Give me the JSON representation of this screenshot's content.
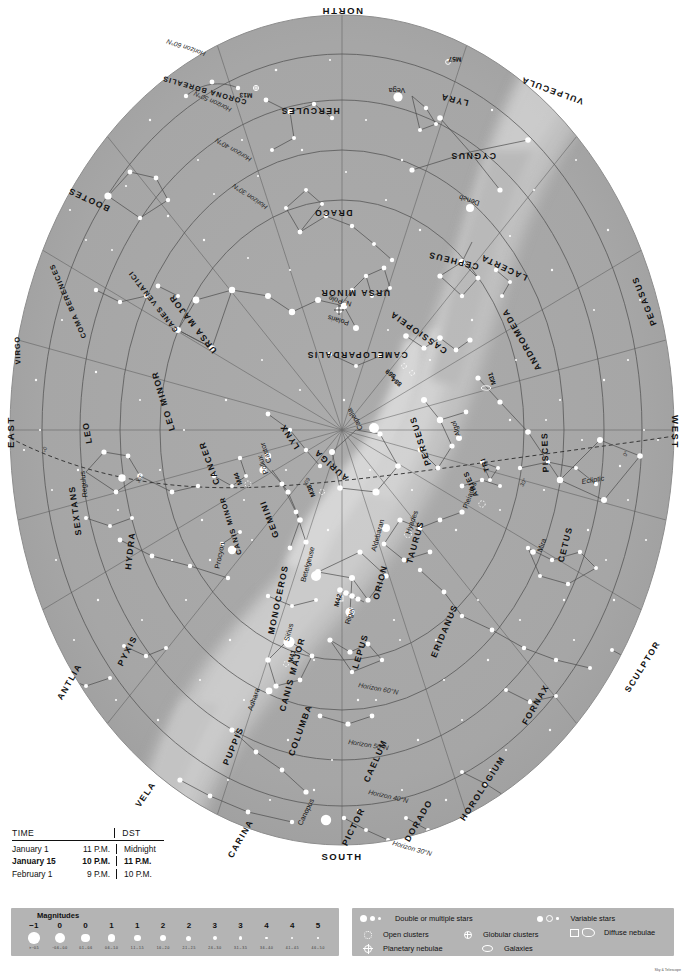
{
  "chart": {
    "cardinals": {
      "north": "NORTH",
      "south": "SOUTH",
      "east": "EAST",
      "west": "WEST"
    },
    "pole_marker": {
      "star": "Polaris",
      "label": "N. Pole"
    },
    "ecliptic_label": "Ecliptic",
    "altitude_marks": [
      "0°",
      "30°",
      "60°"
    ],
    "horizon_lines": [
      "Horizon 30°N",
      "Horizon 40°N",
      "Horizon 50°N",
      "Horizon 60°N"
    ],
    "constellations": [
      {
        "name": "CORONA BOREALIS",
        "x": 205,
        "y": 88,
        "rot": 196,
        "size": "small"
      },
      {
        "name": "HERCULES",
        "x": 310,
        "y": 108,
        "rot": 180
      },
      {
        "name": "LYRA",
        "x": 455,
        "y": 97,
        "rot": 194
      },
      {
        "name": "VULPECULA",
        "x": 553,
        "y": 88,
        "rot": 200
      },
      {
        "name": "CYGNUS",
        "x": 473,
        "y": 153,
        "rot": 180
      },
      {
        "name": "BOOTES",
        "x": 90,
        "y": 197,
        "rot": 205
      },
      {
        "name": "DRACO",
        "x": 333,
        "y": 210,
        "rot": 180
      },
      {
        "name": "CEPHEUS",
        "x": 454,
        "y": 258,
        "rot": 194
      },
      {
        "name": "LACERTA",
        "x": 505,
        "y": 265,
        "rot": 205
      },
      {
        "name": "COMA BERENICES",
        "x": 70,
        "y": 300,
        "rot": 246,
        "size": "small"
      },
      {
        "name": "CANES VENATICI",
        "x": 155,
        "y": 300,
        "rot": 232,
        "size": "small"
      },
      {
        "name": "URSA MAJOR",
        "x": 195,
        "y": 322,
        "rot": 232
      },
      {
        "name": "URSA MINOR",
        "x": 355,
        "y": 290,
        "rot": 180
      },
      {
        "name": "CASSIOPEIA",
        "x": 420,
        "y": 330,
        "rot": 215
      },
      {
        "name": "CAMELOPARDALIS",
        "x": 357,
        "y": 352,
        "rot": 180
      },
      {
        "name": "ANDROMEDA",
        "x": 524,
        "y": 338,
        "rot": 240
      },
      {
        "name": "PEGASUS",
        "x": 647,
        "y": 300,
        "rot": 248
      },
      {
        "name": "VIRGO",
        "x": 20,
        "y": 350,
        "rot": 268,
        "size": "small"
      },
      {
        "name": "LEO MINOR",
        "x": 166,
        "y": 400,
        "rot": 253
      },
      {
        "name": "LEO",
        "x": 90,
        "y": 432,
        "rot": 260
      },
      {
        "name": "LYNX",
        "x": 292,
        "y": 435,
        "rot": 237
      },
      {
        "name": "AURIGA",
        "x": 333,
        "y": 463,
        "rot": 222
      },
      {
        "name": "PERSEUS",
        "x": 423,
        "y": 440,
        "rot": 252
      },
      {
        "name": "TRI",
        "x": 487,
        "y": 464,
        "rot": 250,
        "size": "small"
      },
      {
        "name": "ARIES",
        "x": 473,
        "y": 483,
        "rot": 246,
        "size": "small"
      },
      {
        "name": "PISCES",
        "x": 548,
        "y": 452,
        "rot": 268
      },
      {
        "name": "CANCER",
        "x": 212,
        "y": 462,
        "rot": 250
      },
      {
        "name": "GEMINI",
        "x": 272,
        "y": 518,
        "rot": 249
      },
      {
        "name": "CANIS MINOR",
        "x": 233,
        "y": 525,
        "rot": 253,
        "size": "small"
      },
      {
        "name": "TAURUS",
        "x": 418,
        "y": 543,
        "rot": 286
      },
      {
        "name": "CETUS",
        "x": 568,
        "y": 545,
        "rot": 284
      },
      {
        "name": "SEXTANS",
        "x": 78,
        "y": 510,
        "rot": 262
      },
      {
        "name": "HYDRA",
        "x": 133,
        "y": 551,
        "rot": 276
      },
      {
        "name": "ORION",
        "x": 383,
        "y": 583,
        "rot": 285
      },
      {
        "name": "MONOCEROS",
        "x": 281,
        "y": 600,
        "rot": 282
      },
      {
        "name": "ERIDANUS",
        "x": 447,
        "y": 632,
        "rot": 293
      },
      {
        "name": "LEPUS",
        "x": 363,
        "y": 652,
        "rot": 287
      },
      {
        "name": "CANIS MAJOR",
        "x": 295,
        "y": 675,
        "rot": 285
      },
      {
        "name": "ANTLIA",
        "x": 72,
        "y": 683,
        "rot": 300
      },
      {
        "name": "PYXIS",
        "x": 130,
        "y": 652,
        "rot": 297
      },
      {
        "name": "SCULPTOR",
        "x": 645,
        "y": 668,
        "rot": 302
      },
      {
        "name": "FORNAX",
        "x": 538,
        "y": 706,
        "rot": 300
      },
      {
        "name": "COLUMBA",
        "x": 303,
        "y": 731,
        "rot": 290
      },
      {
        "name": "CAELUM",
        "x": 378,
        "y": 762,
        "rot": 294
      },
      {
        "name": "PUPPIS",
        "x": 236,
        "y": 747,
        "rot": 293
      },
      {
        "name": "HOROLOGIUM",
        "x": 485,
        "y": 790,
        "rot": 303
      },
      {
        "name": "VELA",
        "x": 148,
        "y": 796,
        "rot": 305
      },
      {
        "name": "DORADO",
        "x": 421,
        "y": 822,
        "rot": 300
      },
      {
        "name": "PICTOR",
        "x": 356,
        "y": 828,
        "rot": 296
      },
      {
        "name": "CARINA",
        "x": 243,
        "y": 840,
        "rot": 300
      }
    ],
    "named_stars": [
      {
        "name": "Vega",
        "x": 397,
        "y": 88,
        "rot": 180
      },
      {
        "name": "Deneb",
        "x": 470,
        "y": 198,
        "rot": 198
      },
      {
        "name": "Polaris",
        "x": 339,
        "y": 318,
        "rot": 196
      },
      {
        "name": "Capella",
        "x": 357,
        "y": 418,
        "rot": 240
      },
      {
        "name": "Algol",
        "x": 458,
        "y": 428,
        "rot": 252
      },
      {
        "name": "Castor",
        "x": 268,
        "y": 452,
        "rot": 250
      },
      {
        "name": "Pollux",
        "x": 265,
        "y": 464,
        "rot": 250
      },
      {
        "name": "Pleiades",
        "x": 472,
        "y": 496,
        "rot": 290
      },
      {
        "name": "Regulus",
        "x": 86,
        "y": 484,
        "rot": 264
      },
      {
        "name": "Aldebaran",
        "x": 380,
        "y": 536,
        "rot": 285
      },
      {
        "name": "Hyades",
        "x": 414,
        "y": 523,
        "rot": 290
      },
      {
        "name": "Mira",
        "x": 544,
        "y": 546,
        "rot": 290
      },
      {
        "name": "Procyon",
        "x": 222,
        "y": 556,
        "rot": 282
      },
      {
        "name": "Betelgeuse",
        "x": 310,
        "y": 565,
        "rot": 285
      },
      {
        "name": "Rigel",
        "x": 352,
        "y": 617,
        "rot": 287
      },
      {
        "name": "Sirius",
        "x": 291,
        "y": 633,
        "rot": 285
      },
      {
        "name": "Adhara",
        "x": 256,
        "y": 700,
        "rot": 290
      },
      {
        "name": "Canopus",
        "x": 308,
        "y": 813,
        "rot": 296
      }
    ],
    "deep_sky_objects": [
      {
        "name": "M57",
        "x": 455,
        "y": 57,
        "rot": 182
      },
      {
        "name": "M13",
        "x": 246,
        "y": 93,
        "rot": 182
      },
      {
        "name": "869",
        "x": 392,
        "y": 372,
        "rot": 218
      },
      {
        "name": "884",
        "x": 398,
        "y": 380,
        "rot": 218
      },
      {
        "name": "M31",
        "x": 494,
        "y": 378,
        "rot": 252
      },
      {
        "name": "M44",
        "x": 240,
        "y": 478,
        "rot": 250
      },
      {
        "name": "M38",
        "x": 313,
        "y": 490,
        "rot": 248
      },
      {
        "name": "M42",
        "x": 340,
        "y": 601,
        "rot": 286
      },
      {
        "name": "M41",
        "x": 294,
        "y": 657,
        "rot": 286
      }
    ]
  },
  "time_table": {
    "col_time": "TIME",
    "col_dst": "DST",
    "rows": [
      {
        "date": "January 1",
        "standard": "11 P.M.",
        "dst": "Midnight",
        "highlight": false
      },
      {
        "date": "January 15",
        "standard": "10 P.M.",
        "dst": "11 P.M.",
        "highlight": true
      },
      {
        "date": "February 1",
        "standard": "9 P.M.",
        "dst": "10 P.M.",
        "highlight": false
      }
    ]
  },
  "magnitude_legend": {
    "title": "Magnitudes",
    "entries": [
      {
        "mag": "−1",
        "range": "> −0.5",
        "size": 11.5
      },
      {
        "mag": "0",
        "range": "−0.6 – 0.0",
        "size": 10.0
      },
      {
        "mag": "0",
        "range": "0.1 – 0.6",
        "size": 8.8
      },
      {
        "mag": "1",
        "range": "0.6 – 1.0",
        "size": 7.8
      },
      {
        "mag": "1",
        "range": "1.1 – 1.5",
        "size": 6.8
      },
      {
        "mag": "2",
        "range": "1.6 – 2.0",
        "size": 5.9
      },
      {
        "mag": "2",
        "range": "2.1 – 2.5",
        "size": 5.0
      },
      {
        "mag": "3",
        "range": "2.6 – 3.0",
        "size": 4.2
      },
      {
        "mag": "3",
        "range": "3.1 – 3.5",
        "size": 3.4
      },
      {
        "mag": "4",
        "range": "3.6 – 4.0",
        "size": 2.7
      },
      {
        "mag": "4",
        "range": "4.1 – 4.5",
        "size": 2.0
      },
      {
        "mag": "5",
        "range": "4.6 – 5.0",
        "size": 1.4
      }
    ]
  },
  "symbol_legend": {
    "items": [
      {
        "key": "double-stars",
        "label": "Double or multiple stars"
      },
      {
        "key": "variable-stars",
        "label": "Variable stars"
      },
      {
        "key": "open-clusters",
        "label": "Open clusters"
      },
      {
        "key": "globular-clusters",
        "label": "Globular clusters"
      },
      {
        "key": "diffuse-nebulae",
        "label": "Diffuse nebulae"
      },
      {
        "key": "planetary-nebulae",
        "label": "Planetary nebulae"
      },
      {
        "key": "galaxies",
        "label": "Galaxies"
      }
    ]
  },
  "colors": {
    "sky": "#a9a9a9",
    "sky_outer": "#9e9e9e",
    "milky_way": "#c6c6c6",
    "milky_way_bright": "#d8d8d8",
    "star": "#ffffff",
    "line": "#5d5d5d",
    "legend_bg": "#b4b4b4",
    "text": "#111111"
  },
  "credit": "Sky & Telescope"
}
